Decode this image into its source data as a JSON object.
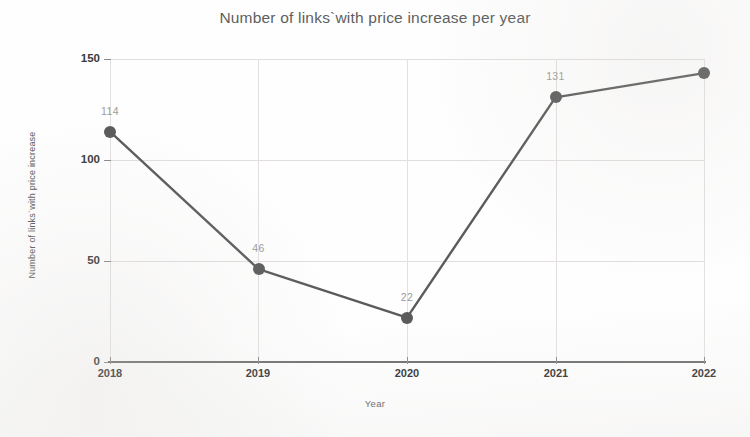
{
  "chart_data": {
    "type": "line",
    "title": "Number of links`with price increase per year",
    "xlabel": "Year",
    "ylabel": "Number of links`with price increase",
    "categories": [
      "2018",
      "2019",
      "2020",
      "2021",
      "2022"
    ],
    "values": [
      114,
      46,
      22,
      131,
      143
    ],
    "point_labels": [
      "114",
      "46",
      "22",
      "131",
      ""
    ],
    "ylim": [
      0,
      150
    ],
    "ytick_labels": [
      "0",
      "50",
      "100",
      "150"
    ],
    "ytick_values": [
      0,
      50,
      100,
      150
    ],
    "xtick_labels": [
      "2018",
      "2019",
      "2020",
      "2021",
      "2022"
    ],
    "grid": "both-light",
    "legend": "none",
    "series": [
      {
        "name": "Number of links with price increase",
        "values": [
          114,
          46,
          22,
          131,
          143
        ],
        "line_color": "#5b5b5b",
        "marker_color": "#5b5b5b"
      }
    ],
    "colors": {
      "line": "#5b5b5b",
      "marker": "#5b5b5b",
      "gridline": "#e2dede",
      "axis": "#6d6d6d",
      "title_text": "#5e5e5e",
      "tick_text": "#2e2e2e",
      "data_label_text": "#9b9b9b",
      "background": "#fefefe"
    }
  }
}
